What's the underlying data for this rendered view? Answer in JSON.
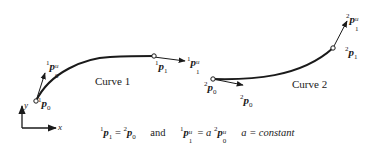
{
  "diagram": {
    "curve1": {
      "name": "Curve 1",
      "p0_label": {
        "pre": "1",
        "main": "p",
        "sub": "0"
      },
      "p0u_label": {
        "pre": "1",
        "main": "p",
        "sup": "u",
        "sub": "0"
      },
      "p1_label": {
        "pre": "1",
        "main": "p",
        "sub": "1"
      },
      "p1u_label": {
        "pre": "1",
        "main": "p",
        "sup": "u",
        "sub": "1"
      }
    },
    "curve2": {
      "name": "Curve 2",
      "p0_label": {
        "pre": "2",
        "main": "p",
        "sub": "0"
      },
      "p0u_label": {
        "pre": "2",
        "main": "p",
        "sub": "0"
      },
      "p1_label": {
        "pre": "2",
        "main": "p",
        "sub": "1"
      },
      "p1u_label": {
        "pre": "2",
        "main": "p",
        "sup": "u",
        "sub": "1"
      }
    },
    "axes": {
      "x": "x",
      "y": "y"
    },
    "equation": {
      "part1_pre_a": "1",
      "part1_main_a": "p",
      "part1_sub_a": "1",
      "equals": " = ",
      "part1_pre_b": "2",
      "part1_main_b": "p",
      "part1_sub_b": "0",
      "and": "and",
      "part2_pre_a": "1",
      "part2_main_a": "p",
      "part2_sup_a": "u",
      "part2_sub_a": "1",
      "equals2": " = ",
      "coef": "a",
      "part2_pre_b": "2",
      "part2_main_b": "p",
      "part2_sup_b": "u",
      "part2_sub_b": "0",
      "constant": "a = constant"
    },
    "colors": {
      "stroke": "#1a1a1a",
      "background": "#ffffff"
    }
  }
}
